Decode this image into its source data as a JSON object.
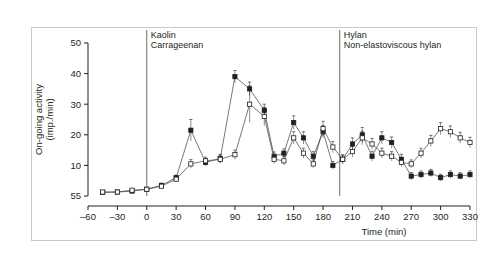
{
  "chart_data": {
    "type": "line",
    "title": "",
    "subtitle": "",
    "xlabel": "Time (min)",
    "ylabel": "On-going activity\n(imp./min)",
    "ylabel_line1": "On-going activity",
    "ylabel_line2": "(imp./min)",
    "xlim": [
      -60,
      330
    ],
    "ylim": [
      0,
      50
    ],
    "xticks": [
      -60,
      -30,
      0,
      30,
      60,
      90,
      120,
      150,
      180,
      210,
      240,
      270,
      300,
      330
    ],
    "xtick_labels": [
      "–60",
      "–30",
      "0",
      "30",
      "60",
      "90",
      "120",
      "150",
      "180",
      "210",
      "240",
      "270",
      "300",
      "330"
    ],
    "yticks": [
      0,
      10,
      20,
      30,
      40,
      50
    ],
    "ytick_labels": [
      "55",
      "10",
      "20",
      "30",
      "40",
      "50"
    ],
    "grid": false,
    "legend": "none",
    "marker_filled": "filled-square",
    "marker_open": "open-square",
    "errorbars": true,
    "annotations": [
      {
        "name": "kaolin-carrageenan",
        "x": 0,
        "line1": "Kaolin",
        "line2": "Carrageenan"
      },
      {
        "name": "hylan-non-elastoviscous",
        "x": 197,
        "line1": "Hylan",
        "line2": "Non-elastoviscous hylan"
      }
    ],
    "vlines": [
      0,
      197
    ],
    "series": [
      {
        "name": "Hylan",
        "marker": "filled-square",
        "x": [
          -45,
          -30,
          -15,
          0,
          15,
          30,
          45,
          60,
          75,
          90,
          105,
          120,
          130,
          140,
          150,
          160,
          170,
          180,
          190,
          200,
          210,
          220,
          230,
          240,
          250,
          260,
          270,
          280,
          290,
          300,
          310,
          320,
          330
        ],
        "y": [
          1.2,
          1.3,
          1.6,
          2.2,
          3.5,
          6.0,
          21.5,
          11.0,
          12.2,
          39.0,
          35.0,
          28.0,
          13.0,
          14.0,
          24.0,
          19.0,
          13.0,
          21.0,
          10.0,
          12.0,
          17.0,
          20.0,
          13.0,
          19.0,
          17.5,
          12.0,
          6.5,
          7.0,
          7.5,
          6.0,
          7.0,
          6.5,
          7.0
        ],
        "yerr": [
          0.4,
          0.4,
          0.4,
          0.5,
          0.6,
          0.8,
          3.5,
          1.2,
          1.4,
          2.0,
          2.2,
          2.0,
          1.4,
          1.4,
          2.2,
          2.0,
          1.5,
          2.0,
          1.3,
          1.4,
          2.0,
          2.4,
          1.6,
          2.0,
          1.8,
          1.6,
          1.2,
          1.2,
          1.2,
          1.1,
          1.2,
          1.1,
          1.2
        ]
      },
      {
        "name": "Non-elastoviscous hylan",
        "marker": "open-square",
        "x": [
          -45,
          -30,
          -15,
          0,
          15,
          30,
          45,
          60,
          75,
          90,
          105,
          120,
          130,
          140,
          150,
          160,
          170,
          180,
          190,
          200,
          210,
          220,
          230,
          240,
          250,
          260,
          270,
          280,
          290,
          300,
          310,
          320,
          330
        ],
        "y": [
          1.3,
          1.3,
          1.9,
          2.2,
          3.2,
          5.5,
          10.5,
          11.5,
          12.0,
          13.5,
          30.0,
          26.0,
          12.0,
          11.5,
          19.0,
          14.0,
          10.5,
          22.0,
          16.0,
          12.0,
          14.5,
          19.0,
          17.0,
          14.0,
          13.0,
          11.0,
          10.5,
          14.0,
          18.0,
          22.0,
          21.0,
          19.0,
          17.5
        ],
        "yerr": [
          0.4,
          0.4,
          0.4,
          0.5,
          0.6,
          0.8,
          1.4,
          1.2,
          1.3,
          1.5,
          6.0,
          3.0,
          1.4,
          1.4,
          2.0,
          1.6,
          1.3,
          2.4,
          1.8,
          1.4,
          1.8,
          2.2,
          1.8,
          1.6,
          1.5,
          1.4,
          1.3,
          1.6,
          1.8,
          2.0,
          1.9,
          1.8,
          1.7
        ]
      }
    ]
  }
}
